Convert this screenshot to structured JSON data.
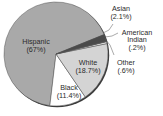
{
  "chart_data": {
    "type": "pie",
    "title": "",
    "categories": [
      "Hispanic",
      "Black",
      "White",
      "Other",
      "American Indian",
      "Asian"
    ],
    "values": [
      67,
      11.4,
      18.7,
      0.6,
      0.2,
      2.1
    ],
    "unit": "%",
    "colors": [
      "#a9a9a9",
      "#ffffff",
      "#d4d4d4",
      "#e8e8e8",
      "#777777",
      "#4a4a4a"
    ],
    "labels": [
      {
        "name": "Hispanic",
        "value": "(67%)"
      },
      {
        "name": "Black",
        "value": "(11.4%)"
      },
      {
        "name": "White",
        "value": "(18.7%)"
      },
      {
        "name": "Other",
        "value": "(.6%)"
      },
      {
        "name": "American",
        "name2": "Indian",
        "value": "(.2%)"
      },
      {
        "name": "Asian",
        "value": "(2.1%)"
      }
    ],
    "legend": "none (direct labels)"
  }
}
